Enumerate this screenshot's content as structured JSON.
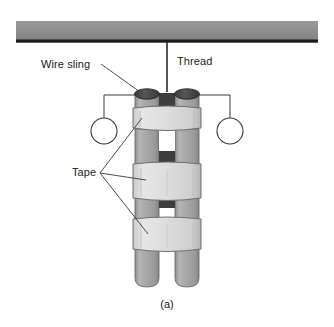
{
  "figure": {
    "caption": "(a)",
    "width": 334,
    "height": 327
  },
  "labels": {
    "wire_sling": "Wire sling",
    "thread": "Thread",
    "tape": "Tape"
  },
  "colors": {
    "support_bar": "#8a8a8a",
    "support_bar_edge": "#1c1c1c",
    "cylinder_body": "#a8a8a8",
    "cylinder_body_light": "#c2c2c2",
    "cylinder_cap": "#4a4a4a",
    "tape_band": "#dcdcdc",
    "tape_band_edge": "#6e6e6e",
    "gap_dark": "#3d3d3d",
    "line": "#2b2b2b",
    "text": "#1a1a1a",
    "background": "#ffffff"
  },
  "components": {
    "support_bar_name": "ceiling support bar",
    "thread_name": "suspension thread",
    "cylinder_left_name": "left cylinder",
    "cylinder_right_name": "right cylinder",
    "tape_band_count": 3,
    "sling_ring_count": 2
  }
}
